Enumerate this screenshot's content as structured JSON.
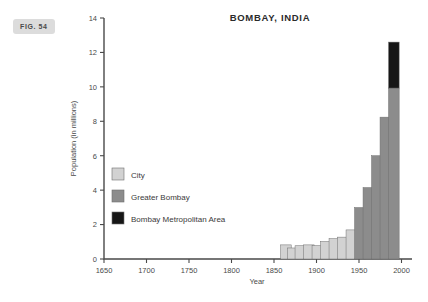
{
  "figure_label": "FIG. 54",
  "chart_data": {
    "type": "bar",
    "title": "BOMBAY, INDIA",
    "xlabel": "Year",
    "ylabel": "Population (in millions)",
    "xlim": [
      1650,
      2010
    ],
    "ylim": [
      0,
      14
    ],
    "xticks": [
      1650,
      1700,
      1750,
      1800,
      1850,
      1900,
      1950,
      2000
    ],
    "yticks": [
      0,
      2,
      4,
      6,
      8,
      10,
      12,
      14
    ],
    "grid": false,
    "legend_position": "inside-left",
    "stacked": true,
    "colors": {
      "city": "#d2d2d2",
      "greater_bombay": "#8c8c8c",
      "metropolitan_area": "#161616"
    },
    "legend": [
      {
        "label": "City",
        "color": "#d2d2d2"
      },
      {
        "label": "Greater Bombay",
        "color": "#8c8c8c"
      },
      {
        "label": "Bombay Metropolitan Area",
        "color": "#161616"
      }
    ],
    "categories": [
      1864,
      1872,
      1881,
      1891,
      1901,
      1911,
      1921,
      1931,
      1941,
      1951,
      1961,
      1971,
      1981,
      1991
    ],
    "series": [
      {
        "name": "City",
        "values": [
          0.82,
          0.64,
          0.77,
          0.82,
          0.78,
          1.02,
          1.18,
          1.27,
          1.69,
          0,
          0,
          0,
          0,
          0
        ]
      },
      {
        "name": "Greater Bombay",
        "values": [
          0,
          0,
          0,
          0,
          0,
          0,
          0,
          0,
          0,
          2.99,
          4.15,
          6.0,
          8.24,
          9.93
        ]
      },
      {
        "name": "Bombay Metropolitan Area",
        "values": [
          0,
          0,
          0,
          0,
          0,
          0,
          0,
          0,
          0,
          0,
          0,
          0,
          0,
          2.67
        ]
      }
    ]
  }
}
